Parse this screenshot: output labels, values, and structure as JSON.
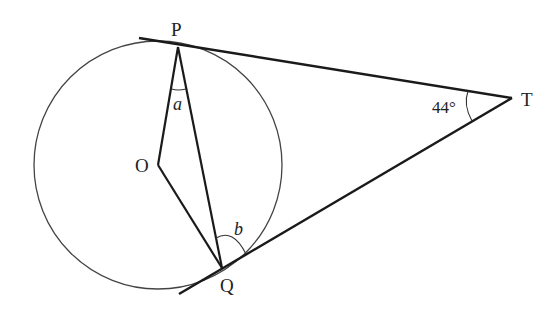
{
  "diagram": {
    "type": "circle-tangents-geometry",
    "colors": {
      "stroke": "#1a1a1a",
      "circle": "#444444",
      "text": "#222222",
      "background": "#ffffff"
    },
    "circle": {
      "center_label": "O",
      "cx": 158,
      "cy": 165,
      "r": 124
    },
    "points": {
      "P": {
        "label": "P",
        "x": 178,
        "y": 47
      },
      "Q": {
        "label": "Q",
        "x": 222,
        "y": 268
      },
      "O": {
        "label": "O",
        "x": 158,
        "y": 165
      },
      "T": {
        "label": "T",
        "x": 512,
        "y": 98
      }
    },
    "angles": {
      "a": {
        "label": "a",
        "at": "P",
        "between": [
          "PO",
          "PQ"
        ]
      },
      "b": {
        "label": "b",
        "at": "Q",
        "between": [
          "QP",
          "QT"
        ]
      },
      "T": {
        "label": "44°",
        "at": "T",
        "between": [
          "TP",
          "TQ"
        ]
      }
    },
    "segments": [
      "PT (tangent)",
      "QT (tangent)",
      "OP",
      "OQ",
      "PQ"
    ]
  }
}
